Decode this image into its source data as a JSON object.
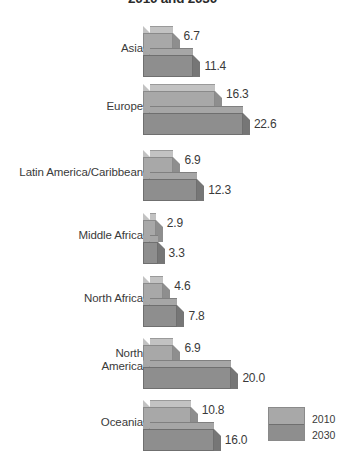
{
  "chart_data": {
    "type": "bar",
    "title": "2010 and 2030",
    "orientation": "horizontal",
    "style": "3d-bars",
    "xlabel": "",
    "ylabel": "",
    "grid": false,
    "legend_position": "bottom-right",
    "categories": [
      "Asia",
      "Europe",
      "Latin America/Caribbean",
      "Middle Africa",
      "North Africa",
      "North\nAmerica",
      "Oceania"
    ],
    "series": [
      {
        "name": "2010",
        "color": "#a8a8a8",
        "values": [
          6.7,
          16.3,
          6.9,
          2.9,
          4.6,
          6.9,
          10.8
        ]
      },
      {
        "name": "2030",
        "color": "#8e8e8e",
        "values": [
          11.4,
          22.6,
          12.3,
          3.3,
          7.8,
          20.0,
          16.0
        ]
      }
    ],
    "value_labels": [
      [
        "6.7",
        "11.4"
      ],
      [
        "16.3",
        "22.6"
      ],
      [
        "6.9",
        "12.3"
      ],
      [
        "2.9",
        "3.3"
      ],
      [
        "4.6",
        "7.8"
      ],
      [
        "6.9",
        "20.0"
      ],
      [
        "10.8",
        "16.0"
      ]
    ],
    "xlim": [
      0,
      22.6
    ],
    "legend": [
      "2010",
      "2030"
    ]
  },
  "legend": {
    "top_label": "2010",
    "bottom_label": "2030"
  }
}
